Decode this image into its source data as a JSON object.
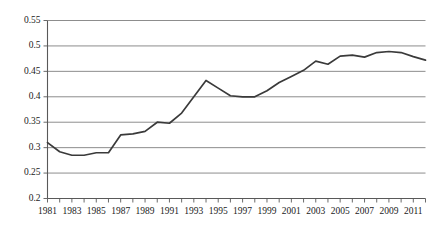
{
  "chart_data": {
    "type": "line",
    "title": "",
    "subtitle": "",
    "xlabel": "",
    "ylabel": "",
    "grid": "horizontal",
    "legend": "none",
    "ylim": [
      0.2,
      0.55
    ],
    "yticks": [
      0.2,
      0.25,
      0.3,
      0.35,
      0.4,
      0.45,
      0.5,
      0.55
    ],
    "ytick_labels": [
      "0.2",
      "0.25",
      "0.3",
      "0.35",
      "0.4",
      "0.45",
      "0.5",
      "0.55"
    ],
    "xlim": [
      1981,
      2012
    ],
    "xticks": [
      1981,
      1982,
      1983,
      1984,
      1985,
      1986,
      1987,
      1988,
      1989,
      1990,
      1991,
      1992,
      1993,
      1994,
      1995,
      1996,
      1997,
      1998,
      1999,
      2000,
      2001,
      2002,
      2003,
      2004,
      2005,
      2006,
      2007,
      2008,
      2009,
      2010,
      2011,
      2012
    ],
    "xtick_labels": [
      "1981",
      "1983",
      "1985",
      "1987",
      "1989",
      "1991",
      "1993",
      "1995",
      "1997",
      "1999",
      "2001",
      "2003",
      "2005",
      "2007",
      "2009",
      "2011"
    ],
    "xtick_label_years": [
      1981,
      1983,
      1985,
      1987,
      1989,
      1991,
      1993,
      1995,
      1997,
      1999,
      2001,
      2003,
      2005,
      2007,
      2009,
      2011
    ],
    "series": [
      {
        "name": "series-1",
        "color": "#3a3a3a",
        "x": [
          1981,
          1982,
          1983,
          1984,
          1985,
          1986,
          1987,
          1988,
          1989,
          1990,
          1991,
          1992,
          1993,
          1994,
          1995,
          1996,
          1997,
          1998,
          1999,
          2000,
          2001,
          2002,
          2003,
          2004,
          2005,
          2006,
          2007,
          2008,
          2009,
          2010,
          2011,
          2012
        ],
        "values": [
          0.31,
          0.292,
          0.285,
          0.285,
          0.29,
          0.29,
          0.325,
          0.327,
          0.332,
          0.35,
          0.348,
          0.368,
          0.4,
          0.432,
          0.417,
          0.402,
          0.4,
          0.4,
          0.412,
          0.428,
          0.44,
          0.452,
          0.47,
          0.464,
          0.48,
          0.482,
          0.478,
          0.487,
          0.489,
          0.487,
          0.479,
          0.472
        ]
      }
    ]
  },
  "axis": {
    "ytick_decimals": 2,
    "tick_color": "#595959",
    "grid_color": "#808080"
  }
}
